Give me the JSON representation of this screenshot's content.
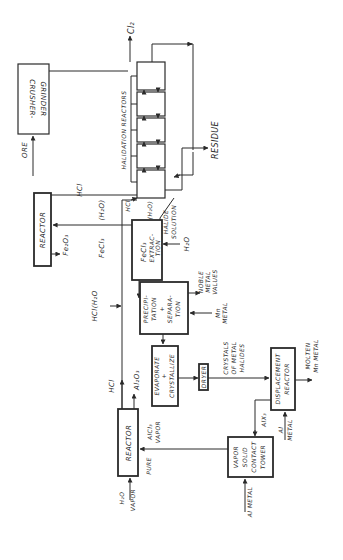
{
  "diagram": {
    "type": "process-flow",
    "orientation": "rotated-90-ccw",
    "units": [
      {
        "id": "crusher",
        "label_lines": [
          "CRUSHER-",
          "GRINDER"
        ]
      },
      {
        "id": "halidation",
        "label": "HALIDATION REACTORS",
        "stages": 5
      },
      {
        "id": "reactor1",
        "label": "REACTOR"
      },
      {
        "id": "extraction",
        "label_lines": [
          "FeCl3",
          "EXTRAC-",
          "TION"
        ]
      },
      {
        "id": "precipitation",
        "label_lines": [
          "PRECIPI-",
          "TATION",
          "+",
          "SEPARA-",
          "TION"
        ]
      },
      {
        "id": "evaporate",
        "label_lines": [
          "EVAPORATE",
          "+",
          "CRYSTALLIZE"
        ]
      },
      {
        "id": "dryer",
        "label": "DRYER"
      },
      {
        "id": "reactor2",
        "label": "REACTOR"
      },
      {
        "id": "vapor_tower",
        "label_lines": [
          "VAPOR",
          "SOLID",
          "CONTACT",
          "TOWER"
        ]
      },
      {
        "id": "displacement",
        "label_lines": [
          "DISPLACEMENT",
          "REACTOR"
        ]
      }
    ],
    "streams": {
      "ore": "ORE",
      "cl2": "Cl₂",
      "hcl_top": "HCl",
      "residue": "RESIDUE",
      "hcl_small": "HCl",
      "h2o_small": "(H₂O)",
      "halide_solution_1": "HALIDE",
      "halide_solution_2": "SOLUTION",
      "fe2o3": "Fe₂O₃",
      "fecl3": "FeCl₃",
      "h2o_paren": "(H₂O)",
      "h2o_in": "H₂O",
      "hcl_h2o": "HCl(H₂O",
      "fe_free_1": "Fe",
      "fe_free_2": "FREE",
      "noble_1": "NOBLE",
      "noble_2": "METAL",
      "noble_3": "VALUES",
      "mn_1": "Mn",
      "mn_2": "METAL",
      "hcl_bottom": "HCl",
      "al2o3": "Al₂O₃",
      "crystals_1": "CRYSTALS",
      "crystals_2": "OF METAL",
      "crystals_3": "HALIDES",
      "molten_1": "MOLTEN",
      "molten_2": "Mn METAL",
      "pure_alcl3_1": "PURE",
      "pure_alcl3_2": "AlCl₃",
      "pure_alcl3_3": "VAPOR",
      "h2o_vapor_1": "H₂O",
      "h2o_vapor_2": "VAPOR",
      "alx3": "AlX₃",
      "al_metal_a_1": "Al",
      "al_metal_a_2": "METAL",
      "al_metal_b": "Al METAL"
    },
    "labels": {
      "crusher_1": "CRUSHER-",
      "crusher_2": "GRINDER",
      "halidation": "HALIDATION REACTORS",
      "reactor1": "REACTOR",
      "ext_1": "FeCl₃",
      "ext_2": "EXTRAC-",
      "ext_3": "TION",
      "prec_1": "PRECIPI-",
      "prec_2": "TATION",
      "prec_3": "+",
      "prec_4": "SEPARA-",
      "prec_5": "TION",
      "evap_1": "EVAPORATE",
      "evap_2": "+",
      "evap_3": "CRYSTALLIZE",
      "dryer": "DRYER",
      "reactor2": "REACTOR",
      "tower_1": "VAPOR",
      "tower_2": "SOLID",
      "tower_3": "CONTACT",
      "tower_4": "TOWER",
      "disp_1": "DISPLACEMENT",
      "disp_2": "REACTOR"
    },
    "colors": {
      "line": "#2a2a2a",
      "background": "#ffffff"
    }
  }
}
